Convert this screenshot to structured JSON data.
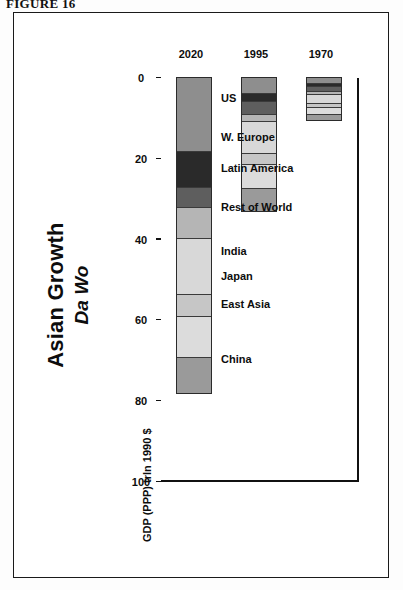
{
  "figure_label": "FIGURE 16",
  "chart_data": {
    "type": "bar",
    "subtype": "stacked-horizontal",
    "title": "Asian Growth",
    "subtitle": "Da Wo",
    "xlabel": "",
    "ylabel": "GDP (PPP) trln 1990 $",
    "categories": [
      "1970",
      "1995",
      "2020"
    ],
    "tick_labels": [
      "100",
      "80",
      "60",
      "40",
      "20",
      "0"
    ],
    "ylim": [
      0,
      100
    ],
    "axis_reversed": true,
    "grid": false,
    "legend_position": "inside-right",
    "series": [
      {
        "name": "China",
        "color": "#8e8e8e",
        "values": [
          1.2,
          3.6,
          18.0
        ]
      },
      {
        "name": "East Asia",
        "color": "#2a2a2a",
        "values": [
          0.7,
          2.2,
          9.0
        ]
      },
      {
        "name": "Japan",
        "color": "#5e5e5e",
        "values": [
          1.3,
          3.0,
          5.0
        ]
      },
      {
        "name": "India",
        "color": "#b5b5b5",
        "values": [
          0.8,
          1.8,
          7.5
        ]
      },
      {
        "name": "Rest of World",
        "color": "#d8d8d8",
        "values": [
          2.2,
          8.0,
          14.0
        ]
      },
      {
        "name": "Latin America",
        "color": "#c6c6c6",
        "values": [
          0.9,
          2.6,
          5.5
        ]
      },
      {
        "name": "W. Europe",
        "color": "#dcdcdc",
        "values": [
          1.8,
          6.0,
          10.0
        ]
      },
      {
        "name": "US",
        "color": "#9a9a9a",
        "values": [
          1.6,
          5.8,
          9.0
        ]
      }
    ],
    "totals": [
      10.5,
      33.0,
      78.0
    ]
  }
}
